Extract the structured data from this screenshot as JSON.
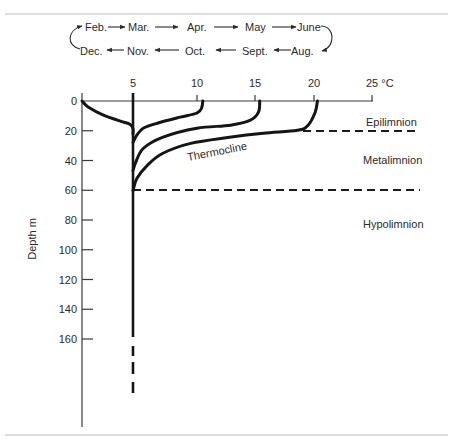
{
  "months": {
    "top_row": [
      "Feb.",
      "Mar.",
      "Apr.",
      "May",
      "June"
    ],
    "bottom_row": [
      "Dec.",
      "Nov.",
      "Oct.",
      "Sept.",
      "Aug."
    ]
  },
  "labels": {
    "epilimnion": "Epilimnion",
    "metalimnion": "Metalimnion",
    "hypolimnion": "Hypolimnion",
    "thermocline": "Thermocline"
  },
  "chart_data": {
    "type": "line",
    "title": "",
    "xlabel": "°C",
    "ylabel": "Depth m",
    "x_axis_position": "top",
    "xlim": [
      0,
      25
    ],
    "ylim": [
      0,
      160
    ],
    "y_inverted": true,
    "x_ticks": [
      5,
      10,
      15,
      20,
      25
    ],
    "x_tick_labels": [
      "5",
      "10",
      "15",
      "20",
      "25 °C"
    ],
    "y_ticks": [
      0,
      20,
      40,
      60,
      80,
      100,
      120,
      140,
      160
    ],
    "y_tick_labels": [
      "0",
      "20",
      "40",
      "60",
      "80",
      "100",
      "120",
      "140",
      "160"
    ],
    "grid": false,
    "legend": "none",
    "series": [
      {
        "name": "Winter profile (surface ~0 °C)",
        "points": [
          [
            0,
            0
          ],
          [
            0.6,
            4
          ],
          [
            2.1,
            9.5
          ],
          [
            4.0,
            14
          ],
          [
            4.7,
            15.6
          ],
          [
            5.0,
            18.5
          ],
          [
            5.0,
            22
          ]
        ]
      },
      {
        "name": "Profile reaching ~10 °C",
        "points": [
          [
            10.5,
            0
          ],
          [
            10.4,
            4.7
          ],
          [
            10.0,
            8.1
          ],
          [
            8.7,
            10.8
          ],
          [
            6.9,
            14.9
          ],
          [
            5.8,
            18.3
          ],
          [
            5.3,
            23
          ],
          [
            5.0,
            27.8
          ]
        ]
      },
      {
        "name": "Profile reaching ~15 °C",
        "points": [
          [
            15.4,
            0
          ],
          [
            15.3,
            7.5
          ],
          [
            14.6,
            12.9
          ],
          [
            12.9,
            16.3
          ],
          [
            10.0,
            18.3
          ],
          [
            7.3,
            24.4
          ],
          [
            5.8,
            31.9
          ],
          [
            5.2,
            41.4
          ],
          [
            5.0,
            46.8
          ]
        ]
      },
      {
        "name": "Summer profile (surface ~20 °C)",
        "points": [
          [
            20.3,
            0
          ],
          [
            20.1,
            7.5
          ],
          [
            19.5,
            16.3
          ],
          [
            18.6,
            19.7
          ],
          [
            15.7,
            21.7
          ],
          [
            12.8,
            24.4
          ],
          [
            9.5,
            28.5
          ],
          [
            7.3,
            35.3
          ],
          [
            6.1,
            43.4
          ],
          [
            5.3,
            52.2
          ],
          [
            5.0,
            60.3
          ]
        ]
      },
      {
        "name": "Deep water (4–5 °C)",
        "points": [
          [
            5,
            0
          ],
          [
            5,
            160
          ]
        ],
        "continues_dashed_below": true
      }
    ],
    "annotations": [
      {
        "text": "Epilimnion",
        "boundary_depth": 20
      },
      {
        "text": "Metalimnion",
        "between_depths": [
          20,
          60
        ]
      },
      {
        "text": "Hypolimnion",
        "below_depth": 60
      },
      {
        "text": "Thermocline",
        "along": "summer profile gradient"
      }
    ],
    "cycle": [
      "Feb.",
      "Mar.",
      "Apr.",
      "May",
      "June",
      "Aug.",
      "Sept.",
      "Oct.",
      "Nov.",
      "Dec."
    ]
  }
}
